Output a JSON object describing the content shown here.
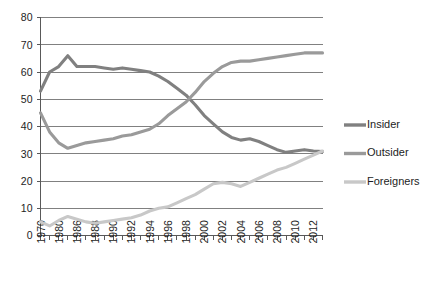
{
  "chart_data": {
    "type": "line",
    "title": "",
    "subtitle": "",
    "xlabel": "",
    "ylabel": "",
    "grid": true,
    "legend_position": "right",
    "ylim": [
      0,
      80
    ],
    "ytick_labels": [
      "0",
      "10",
      "20",
      "30",
      "40",
      "50",
      "60",
      "70",
      "80"
    ],
    "ytick_values": [
      0,
      10,
      20,
      30,
      40,
      50,
      60,
      70,
      80
    ],
    "x": [
      1970,
      1980,
      1985,
      1986,
      1987,
      1988,
      1989,
      1990,
      1991,
      1992,
      1993,
      1994,
      1995,
      1996,
      1997,
      1998,
      1999,
      2000,
      2001,
      2002,
      2003,
      2004,
      2005,
      2006,
      2007,
      2008,
      2009,
      2010,
      2011,
      2012,
      2013,
      2014
    ],
    "xtick_labels": [
      "1970",
      "",
      "1980",
      "",
      "1986",
      "",
      "1988",
      "",
      "1990",
      "",
      "1992",
      "",
      "1994",
      "",
      "1996",
      "",
      "1998",
      "",
      "2000",
      "",
      "2002",
      "",
      "2004",
      "",
      "2006",
      "",
      "2008",
      "",
      "2010",
      "",
      "2012",
      "",
      "2014"
    ],
    "xtick_labels_shown": [
      "1970",
      "1980",
      "1986",
      "1988",
      "1990",
      "1992",
      "1994",
      "1996",
      "1998",
      "2000",
      "2002",
      "2004",
      "2006",
      "2008",
      "2010",
      "2012",
      "2014"
    ],
    "series": [
      {
        "name": "Insider",
        "color": "#808080",
        "values": [
          53,
          60,
          62,
          66,
          62,
          62,
          62,
          61.5,
          61,
          61.5,
          61,
          60.5,
          60,
          58.5,
          56.5,
          54,
          51.5,
          48,
          44,
          41,
          38,
          36,
          35,
          35.5,
          34.5,
          33,
          31.5,
          30.5,
          31,
          31.5,
          31,
          30.8
        ]
      },
      {
        "name": "Outsider",
        "color": "#9a9a9a",
        "values": [
          45,
          38,
          34,
          32,
          33,
          34,
          34.5,
          35,
          35.5,
          36.5,
          37,
          38,
          39,
          41,
          44,
          46.5,
          49,
          52.5,
          56.5,
          59.5,
          62,
          63.5,
          64,
          64,
          64.5,
          65,
          65.5,
          66,
          66.5,
          67,
          67,
          67
        ]
      },
      {
        "name": "Foreigners",
        "color": "#c8c8c8",
        "values": [
          5,
          3.5,
          5.5,
          7,
          6,
          5,
          4.5,
          5,
          5.5,
          6,
          6.5,
          7.5,
          9,
          10,
          10.5,
          12,
          13.5,
          15,
          17,
          19,
          19.5,
          19,
          18,
          19.5,
          21,
          22.5,
          24,
          25,
          26.5,
          28,
          29.5,
          31
        ]
      }
    ],
    "legend": [
      {
        "label": "Insider",
        "color": "#808080"
      },
      {
        "label": "Outsider",
        "color": "#9a9a9a"
      },
      {
        "label": "Foreigners",
        "color": "#c8c8c8"
      }
    ]
  },
  "colors": {
    "insider": "#808080",
    "outsider": "#9a9a9a",
    "foreigners": "#c8c8c8",
    "grid": "#808080",
    "axis": "#595959",
    "background": "#ffffff",
    "text": "#1d1d1d"
  }
}
